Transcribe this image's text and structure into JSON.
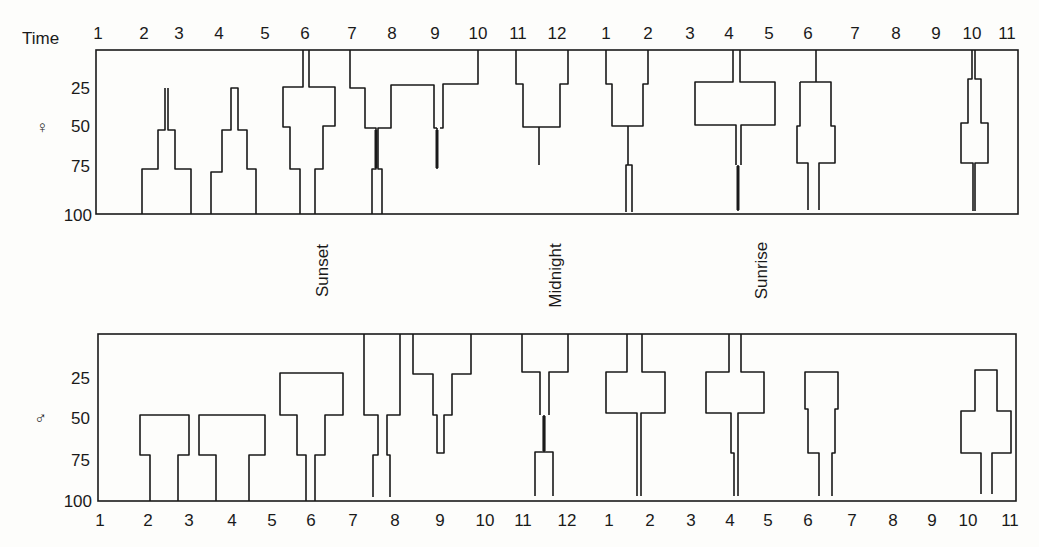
{
  "chart_data": [
    {
      "type": "kite-diagram",
      "panel": "female",
      "symbol": "♀",
      "title": "",
      "xlabel": "Time",
      "ylabel": "♀",
      "y_ticks": [
        25,
        50,
        75,
        100
      ],
      "ylim": [
        0,
        100
      ],
      "y_inverted": true,
      "x_ticks": [
        "1",
        "2",
        "3",
        "4",
        "5",
        "6",
        "7",
        "8",
        "9",
        "10",
        "11",
        "12",
        "1",
        "2",
        "3",
        "4",
        "5",
        "6",
        "7",
        "8",
        "9",
        "10",
        "11"
      ],
      "annotations": [
        "Sunset",
        "Midnight",
        "Sunrise"
      ],
      "note": "Vertical profiles: value range occupied (percent depth) at each time window; width indicates relative abundance",
      "series": [
        {
          "name": "2-3",
          "x_center": 2.5,
          "ranges": [
            {
              "from": 25,
              "to": 50,
              "width": "trace"
            },
            {
              "from": 50,
              "to": 75,
              "width": "narrow"
            },
            {
              "from": 75,
              "to": 100,
              "width": "wide"
            }
          ]
        },
        {
          "name": "4-5",
          "x_center": 4.5,
          "ranges": [
            {
              "from": 25,
              "to": 50,
              "width": "narrow"
            },
            {
              "from": 50,
              "to": 75,
              "width": "medium"
            },
            {
              "from": 75,
              "to": 100,
              "width": "wide"
            }
          ]
        },
        {
          "name": "6",
          "x_center": 6.0,
          "ranges": [
            {
              "from": 0,
              "to": 25,
              "width": "trace"
            },
            {
              "from": 25,
              "to": 50,
              "width": "wide"
            },
            {
              "from": 50,
              "to": 75,
              "width": "medium"
            },
            {
              "from": 75,
              "to": 100,
              "width": "narrow"
            }
          ]
        },
        {
          "name": "7-10",
          "x_center": 8.5,
          "ranges": [
            {
              "from": 0,
              "to": 25,
              "width": "very wide"
            },
            {
              "from": 25,
              "to": 50,
              "width": "split"
            },
            {
              "from": 50,
              "to": 75,
              "width": "trace"
            },
            {
              "from": 75,
              "to": 100,
              "width": "narrow"
            }
          ]
        },
        {
          "name": "11-12",
          "x_center": 11.5,
          "ranges": [
            {
              "from": 0,
              "to": 25,
              "width": "wide"
            },
            {
              "from": 25,
              "to": 50,
              "width": "medium"
            },
            {
              "from": 50,
              "to": 75,
              "width": "trace"
            }
          ]
        },
        {
          "name": "1-2",
          "x_center": 1.5,
          "ranges": [
            {
              "from": 0,
              "to": 25,
              "width": "wide"
            },
            {
              "from": 25,
              "to": 50,
              "width": "medium"
            },
            {
              "from": 50,
              "to": 75,
              "width": "trace"
            },
            {
              "from": 75,
              "to": 100,
              "width": "trace"
            }
          ]
        },
        {
          "name": "4-5 (sunrise)",
          "x_center": 4.5,
          "ranges": [
            {
              "from": 0,
              "to": 25,
              "width": "trace"
            },
            {
              "from": 25,
              "to": 50,
              "width": "very wide"
            },
            {
              "from": 50,
              "to": 75,
              "width": "narrow"
            },
            {
              "from": 75,
              "to": 100,
              "width": "trace"
            }
          ]
        },
        {
          "name": "6 (morning)",
          "x_center": 6.3,
          "ranges": [
            {
              "from": 0,
              "to": 25,
              "width": "trace"
            },
            {
              "from": 25,
              "to": 50,
              "width": "medium"
            },
            {
              "from": 50,
              "to": 75,
              "width": "medium"
            },
            {
              "from": 75,
              "to": 100,
              "width": "narrow"
            }
          ]
        },
        {
          "name": "10-11",
          "x_center": 10.3,
          "ranges": [
            {
              "from": 0,
              "to": 25,
              "width": "trace"
            },
            {
              "from": 25,
              "to": 50,
              "width": "narrow"
            },
            {
              "from": 50,
              "to": 75,
              "width": "medium"
            },
            {
              "from": 75,
              "to": 100,
              "width": "trace"
            }
          ]
        }
      ]
    },
    {
      "type": "kite-diagram",
      "panel": "male",
      "symbol": "♂",
      "title": "",
      "xlabel": "",
      "ylabel": "♂",
      "y_ticks": [
        25,
        50,
        75,
        100
      ],
      "ylim": [
        0,
        100
      ],
      "y_inverted": true,
      "x_ticks": [
        "1",
        "2",
        "3",
        "4",
        "5",
        "6",
        "7",
        "8",
        "9",
        "10",
        "11",
        "12",
        "1",
        "2",
        "3",
        "4",
        "5",
        "6",
        "7",
        "8",
        "9",
        "10",
        "11"
      ],
      "series": [
        {
          "name": "2-3",
          "x_center": 2.5,
          "ranges": [
            {
              "from": 50,
              "to": 75,
              "width": "wide"
            },
            {
              "from": 75,
              "to": 100,
              "width": "medium"
            }
          ]
        },
        {
          "name": "3-5",
          "x_center": 4.0,
          "ranges": [
            {
              "from": 50,
              "to": 75,
              "width": "wide"
            },
            {
              "from": 75,
              "to": 100,
              "width": "medium"
            }
          ]
        },
        {
          "name": "6",
          "x_center": 6.0,
          "ranges": [
            {
              "from": 25,
              "to": 50,
              "width": "wide"
            },
            {
              "from": 50,
              "to": 75,
              "width": "medium"
            },
            {
              "from": 75,
              "to": 100,
              "width": "narrow"
            }
          ]
        },
        {
          "name": "7-8",
          "x_center": 7.6,
          "ranges": [
            {
              "from": 0,
              "to": 50,
              "width": "wide"
            },
            {
              "from": 50,
              "to": 75,
              "width": "narrow"
            },
            {
              "from": 75,
              "to": 100,
              "width": "narrow"
            }
          ]
        },
        {
          "name": "9",
          "x_center": 9.0,
          "ranges": [
            {
              "from": 0,
              "to": 25,
              "width": "wide"
            },
            {
              "from": 25,
              "to": 50,
              "width": "narrow"
            },
            {
              "from": 50,
              "to": 75,
              "width": "trace"
            }
          ]
        },
        {
          "name": "11-12",
          "x_center": 11.5,
          "ranges": [
            {
              "from": 0,
              "to": 25,
              "width": "wide"
            },
            {
              "from": 25,
              "to": 50,
              "width": "narrow"
            },
            {
              "from": 50,
              "to": 75,
              "width": "trace"
            },
            {
              "from": 75,
              "to": 100,
              "width": "narrow"
            }
          ]
        },
        {
          "name": "1-2",
          "x_center": 1.7,
          "ranges": [
            {
              "from": 0,
              "to": 25,
              "width": "narrow"
            },
            {
              "from": 25,
              "to": 50,
              "width": "wide"
            },
            {
              "from": 50,
              "to": 100,
              "width": "trace"
            }
          ]
        },
        {
          "name": "4",
          "x_center": 4.2,
          "ranges": [
            {
              "from": 0,
              "to": 25,
              "width": "narrow"
            },
            {
              "from": 25,
              "to": 50,
              "width": "wide"
            },
            {
              "from": 50,
              "to": 75,
              "width": "narrow"
            },
            {
              "from": 75,
              "to": 100,
              "width": "trace"
            }
          ]
        },
        {
          "name": "6 (morning)",
          "x_center": 6.3,
          "ranges": [
            {
              "from": 25,
              "to": 50,
              "width": "wide"
            },
            {
              "from": 50,
              "to": 75,
              "width": "medium"
            },
            {
              "from": 75,
              "to": 100,
              "width": "narrow"
            }
          ]
        },
        {
          "name": "10-11",
          "x_center": 10.3,
          "ranges": [
            {
              "from": 25,
              "to": 50,
              "width": "narrow"
            },
            {
              "from": 50,
              "to": 75,
              "width": "wide"
            },
            {
              "from": 75,
              "to": 100,
              "width": "narrow"
            }
          ]
        }
      ]
    }
  ],
  "labels": {
    "time_title": "Time",
    "female_symbol": "♀",
    "male_symbol": "♂",
    "sunset": "Sunset",
    "midnight": "Midnight",
    "sunrise": "Sunrise",
    "y_ticks": [
      "25",
      "50",
      "75",
      "100"
    ],
    "top_ticks": [
      "1",
      "2",
      "3",
      "4",
      "5",
      "6",
      "7",
      "8",
      "9",
      "10",
      "11",
      "12",
      "1",
      "2",
      "3",
      "4",
      "5",
      "6",
      "7",
      "8",
      "9",
      "10",
      "11"
    ],
    "bottom_ticks": [
      "1",
      "2",
      "3",
      "4",
      "5",
      "6",
      "7",
      "8",
      "9",
      "10",
      "11",
      "12",
      "1",
      "2",
      "3",
      "4",
      "5",
      "6",
      "7",
      "8",
      "9",
      "10",
      "11"
    ]
  },
  "geometry": {
    "stroke": "#1a1a1a",
    "top_tick_x": [
      98,
      144,
      179,
      219,
      265,
      305,
      352,
      392,
      435,
      478,
      518,
      557,
      606,
      648,
      690,
      729,
      769,
      808,
      855,
      896,
      936,
      972,
      1007
    ],
    "bottom_tick_x": [
      100,
      148,
      189,
      232,
      272,
      311,
      353,
      395,
      440,
      485,
      523,
      567,
      609,
      650,
      691,
      730,
      768,
      808,
      852,
      893,
      932,
      968,
      1010
    ],
    "female_box": {
      "x1": 96,
      "y1": 50,
      "x2": 1018,
      "y2": 214
    },
    "male_box": {
      "x1": 98,
      "y1": 334,
      "x2": 1016,
      "y2": 501
    },
    "female_paths": [
      "M142,214 V169 H158 V130 H165 V88 M168,88 V130 H175 V169 H191 V214",
      "M211,214 V172 H222 V130 H231 V88 H238 V130 H247 V169 H256 V214",
      "M300,214 V169 H290 V127 H283 V87 H303 V50 M309,50 V87 H335 V126 H323 V169 H315 V214",
      "M350,50 V88 H365 V128 H376 V169 H372 V214 M382,214 V169 H378 V128 H391 V85 H434 V128 H437 M437,128 V169 M440,128 H443 V84 H478 V50",
      "M516,50 V84 H523 V127 H560 V84 H568 V50 M539,127 V165",
      "M606,50 V84 H612 V126 H643 V84 H648 V50 M628,126 V165 M626,212 V165 H632 V212",
      "M733,50 V82 H695 V125 H736 V165 M741,165 V125 H775 V82 H740 V50 M738,165 V211",
      "M816,50 V82 M800,82 H831 V126 H835 V163 H819 V210 M808,210 V163 H797 V126 H800 V82",
      "M972,50 V79 H968 V123 H961 V163 H973 V211 M975,211 V163 H988 V123 H981 V79 H975 V50"
    ],
    "male_paths": [
      "M150,501 V455 H140 V415 H189 V455 H178 V501",
      "M216,501 V455 H199 V415 H265 V455 H249 V501",
      "M306,501 V455 H297 V415 H280 V373 H343 V415 H325 V455 H315 V501",
      "M364,334 V415 H378 V455 H373 V497 M390,497 V455 H387 V415 H400 V334",
      "M413,334 V374 H433 V415 H437 V453 H444 V415 H452 V374 H471 V334",
      "M522,334 V372 H540 V415 M549,415 V372 H568 V334 M544,415 V452 M535,496 V452 H553 V496",
      "M627,334 V372 H606 V413 H637 V496 M641,496 V413 H665 V372 H642 V334",
      "M729,334 V372 H706 V413 H731 V453 H734 V496 M738,496 V453 H738 V413 H764 V372 H741 V334",
      "M819,496 V453 H808 V409 H805 V372 H838 V409 H835 V453 H832 V496",
      "M981,494 V453 H961 V411 H975 V370 H997 V411 H1011 V453 H992 V494"
    ],
    "thick_paths_female": [
      "M376,130 V168",
      "M437,130 V168",
      "M738,166 V210"
    ],
    "thick_paths_male": [
      "M544,416 V451"
    ]
  }
}
